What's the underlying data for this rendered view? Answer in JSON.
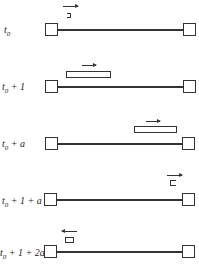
{
  "diagram": {
    "rows": [
      {
        "time_label": "t0",
        "t": "t",
        "sub": "0",
        "rest": "",
        "packet": "leading edge leaving left node",
        "direction": "right"
      },
      {
        "time_label": "t0 + 1",
        "t": "t",
        "sub": "0",
        "rest": " + 1",
        "packet": "fully on link near left",
        "direction": "right"
      },
      {
        "time_label": "t0 + a",
        "t": "t",
        "sub": "0",
        "rest": " + a",
        "packet": "reaching right node",
        "direction": "right"
      },
      {
        "time_label": "t0 + 1 + a",
        "t": "t",
        "sub": "0",
        "rest": " + 1 + a",
        "packet": "trailing edge arriving at right node",
        "direction": "right"
      },
      {
        "time_label": "t0 + 1 + 2a",
        "t": "t",
        "sub": "0",
        "rest": " + 1 + 2a",
        "packet": "acknowledgement near left node",
        "direction": "left"
      }
    ]
  }
}
